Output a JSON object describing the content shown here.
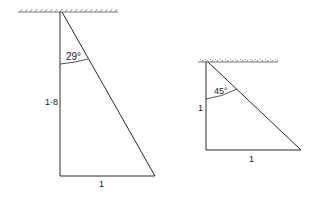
{
  "diagram": {
    "left_triangle": {
      "angle_label": "29°",
      "height_label": "1·8",
      "base_label": "1"
    },
    "right_triangle": {
      "angle_label": "45°",
      "height_label": "1",
      "base_label": "1"
    },
    "colors": {
      "line": "#2a2a2a",
      "ground": "#555555"
    }
  }
}
